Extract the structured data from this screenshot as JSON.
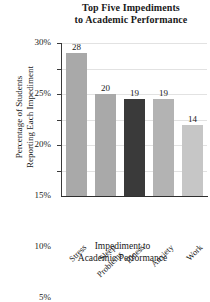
{
  "chart_data": {
    "type": "bar",
    "title": "Top Five Impediments to Academic Performance",
    "title_lines": [
      "Top Five Impediments",
      "to Academic Performance"
    ],
    "xlabel": "Impediment to Academic Performance",
    "xlabel_lines": [
      "Impediment to",
      "Academic Performance"
    ],
    "ylabel": "Percentage of Students Reporting Each Impediment",
    "ylabel_lines": [
      "Percentage of Students",
      "Reporting Each Impediment"
    ],
    "categories": [
      "Stress",
      "Sleep Problems",
      "Illness",
      "Anxiety",
      "Work"
    ],
    "category_lines": [
      [
        "Stress"
      ],
      [
        "Sleep",
        "Problems"
      ],
      [
        "Illness"
      ],
      [
        "Anxiety"
      ],
      [
        "Work"
      ]
    ],
    "values": [
      28,
      20,
      19,
      19,
      14
    ],
    "value_labels": [
      "28",
      "20",
      "19",
      "19",
      "14"
    ],
    "bar_colors": [
      "#a9a9a9",
      "#a9a9a9",
      "#3a3a3a",
      "#b3b3b3",
      "#c6c6c6"
    ],
    "ylim": [
      0,
      30
    ],
    "yticks": [
      5,
      10,
      15,
      20,
      25,
      30
    ],
    "ytick_labels": [
      "5%",
      "10%",
      "15%",
      "20%",
      "25%",
      "30%"
    ],
    "grid": true,
    "grid_color": "#e2e2e2",
    "legend": null,
    "axis_color": "#3a3a3a",
    "background": "#ffffff"
  }
}
